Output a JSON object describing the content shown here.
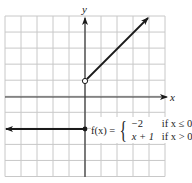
{
  "chart_data": {
    "type": "line",
    "title": "",
    "xlabel": "x",
    "ylabel": "y",
    "xlim": [
      -5,
      5
    ],
    "ylim": [
      -5,
      5
    ],
    "grid": true,
    "grid_step": 1,
    "function_label": "f(x)",
    "pieces": [
      {
        "expr": "−2",
        "condition": "if x ≤ 0",
        "points": [
          [
            -5,
            -2
          ],
          [
            0,
            -2
          ]
        ],
        "left_end": "arrow",
        "right_end": "closed"
      },
      {
        "expr": "x + 1",
        "condition": "if x > 0",
        "points": [
          [
            0,
            1
          ],
          [
            3.9,
            4.9
          ]
        ],
        "left_end": "open",
        "right_end": "arrow"
      }
    ],
    "colors": {
      "line": "#1a1a1a",
      "grid": "#c8c8c8",
      "axis": "#333333"
    }
  },
  "labels": {
    "x_axis": "x",
    "y_axis": "y",
    "fx": "f(x) =",
    "case1_expr": "−2",
    "case1_cond": "if x ≤ 0",
    "case2_expr": "x + 1",
    "case2_cond": "if x > 0"
  }
}
